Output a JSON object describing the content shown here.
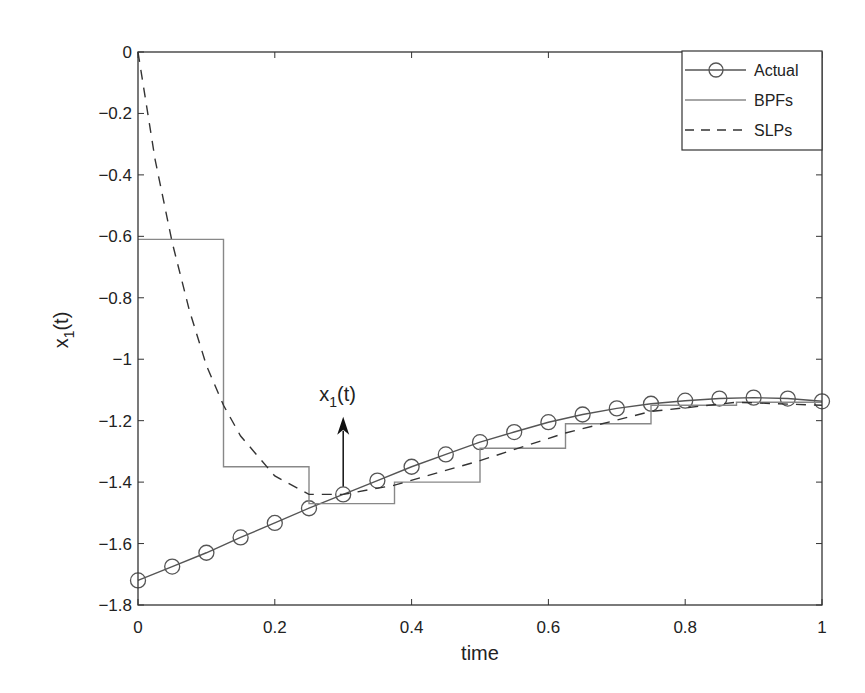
{
  "chart_data": {
    "type": "line",
    "title": "",
    "xlabel": "time",
    "ylabel": "x1(t)",
    "xlim": [
      0,
      1
    ],
    "ylim": [
      -1.8,
      0
    ],
    "xticks": [
      0,
      0.2,
      0.4,
      0.6,
      0.8,
      1
    ],
    "xtick_labels": [
      "0",
      "0.2",
      "0.4",
      "0.6",
      "0.8",
      "1"
    ],
    "yticks": [
      0,
      -0.2,
      -0.4,
      -0.6,
      -0.8,
      -1,
      -1.2,
      -1.4,
      -1.6,
      -1.8
    ],
    "ytick_labels": [
      "0",
      "−0.2",
      "−0.4",
      "−0.6",
      "−0.8",
      "−1",
      "−1.2",
      "−1.4",
      "−1.6",
      "−1.8"
    ],
    "grid": false,
    "legend_position": "upper right",
    "annotation": {
      "text": "x1(t)",
      "arrow_from": [
        0.3,
        -1.44
      ],
      "arrow_to": [
        0.3,
        -1.2
      ]
    },
    "series": [
      {
        "name": "Actual",
        "style": "solid-circle-markers",
        "x": [
          0,
          0.05,
          0.1,
          0.15,
          0.2,
          0.25,
          0.3,
          0.35,
          0.4,
          0.45,
          0.5,
          0.55,
          0.6,
          0.65,
          0.7,
          0.75,
          0.8,
          0.85,
          0.9,
          0.95,
          1.0
        ],
        "values": [
          -1.72,
          -1.675,
          -1.63,
          -1.58,
          -1.533,
          -1.485,
          -1.44,
          -1.395,
          -1.35,
          -1.31,
          -1.27,
          -1.237,
          -1.205,
          -1.18,
          -1.16,
          -1.145,
          -1.135,
          -1.128,
          -1.125,
          -1.128,
          -1.137
        ]
      },
      {
        "name": "BPFs",
        "style": "solid-step",
        "x_edges": [
          0,
          0.125,
          0.25,
          0.375,
          0.5,
          0.625,
          0.75,
          0.875,
          1.0
        ],
        "values": [
          -0.61,
          -1.35,
          -1.47,
          -1.4,
          -1.29,
          -1.21,
          -1.15,
          -1.14
        ]
      },
      {
        "name": "SLPs",
        "style": "dashed",
        "x": [
          0,
          0.025,
          0.05,
          0.075,
          0.1,
          0.125,
          0.15,
          0.2,
          0.25,
          0.3,
          0.375,
          0.5,
          0.625,
          0.75,
          0.875,
          1.0
        ],
        "values": [
          0,
          -0.35,
          -0.62,
          -0.84,
          -1.02,
          -1.15,
          -1.25,
          -1.38,
          -1.44,
          -1.44,
          -1.41,
          -1.33,
          -1.24,
          -1.17,
          -1.14,
          -1.15
        ]
      }
    ]
  },
  "legend": {
    "items": [
      {
        "label": "Actual"
      },
      {
        "label": "BPFs"
      },
      {
        "label": "SLPs"
      }
    ]
  },
  "labels": {
    "xlabel": "time",
    "ylabel_main": "x",
    "ylabel_sub": "1",
    "ylabel_tail": "(t)",
    "annotation_main": "x",
    "annotation_sub": "1",
    "annotation_tail": "(t)"
  },
  "colors": {
    "axes": "#333333",
    "actual": "#555555",
    "bpf": "#888888",
    "slp": "#333333"
  }
}
